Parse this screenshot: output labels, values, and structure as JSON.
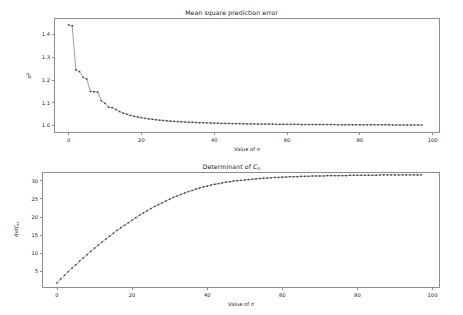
{
  "figure": {
    "width": 463,
    "height": 315,
    "background": "#ffffff",
    "marker_color": "#3f3f3f",
    "line_color": "#5a5a5a",
    "frame_color": "#8d8d8d",
    "text_color": "#1a1a1a"
  },
  "chart_data": [
    {
      "type": "line",
      "id": "mean-square-prediction-error",
      "title": "Mean square prediction error",
      "title_plain": "Mean square prediction error",
      "xlabel": "Value of n",
      "ylabel": "σ²",
      "ylabel_base": "σ",
      "ylabel_sup": "2",
      "xlim": [
        -4,
        102
      ],
      "ylim": [
        0.968,
        1.472
      ],
      "xticks": [
        0,
        20,
        40,
        60,
        80,
        100
      ],
      "xticklabels": [
        "0",
        "20",
        "40",
        "60",
        "80",
        "100"
      ],
      "yticks": [
        1.0,
        1.1,
        1.2,
        1.3,
        1.4
      ],
      "yticklabels": [
        "1.0",
        "1.1",
        "1.2",
        "1.3",
        "1.4"
      ],
      "grid": false,
      "legend": null,
      "marker": "square",
      "x": [
        0,
        1,
        2,
        3,
        4,
        5,
        6,
        7,
        8,
        9,
        10,
        11,
        12,
        13,
        14,
        15,
        16,
        17,
        18,
        19,
        20,
        21,
        22,
        23,
        24,
        25,
        26,
        27,
        28,
        29,
        30,
        31,
        32,
        33,
        34,
        35,
        36,
        37,
        38,
        39,
        40,
        41,
        42,
        43,
        44,
        45,
        46,
        47,
        48,
        49,
        50,
        51,
        52,
        53,
        54,
        55,
        56,
        57,
        58,
        59,
        60,
        61,
        62,
        63,
        64,
        65,
        66,
        67,
        68,
        69,
        70,
        71,
        72,
        73,
        74,
        75,
        76,
        77,
        78,
        79,
        80,
        81,
        82,
        83,
        84,
        85,
        86,
        87,
        88,
        89,
        90,
        91,
        92,
        93,
        94,
        95,
        96,
        97
      ],
      "values": [
        1.442,
        1.438,
        1.245,
        1.237,
        1.212,
        1.205,
        1.15,
        1.149,
        1.147,
        1.11,
        1.098,
        1.081,
        1.079,
        1.071,
        1.062,
        1.055,
        1.05,
        1.045,
        1.041,
        1.038,
        1.035,
        1.032,
        1.03,
        1.028,
        1.026,
        1.024,
        1.023,
        1.021,
        1.02,
        1.019,
        1.018,
        1.017,
        1.016,
        1.015,
        1.015,
        1.014,
        1.013,
        1.013,
        1.012,
        1.012,
        1.011,
        1.011,
        1.01,
        1.01,
        1.01,
        1.009,
        1.009,
        1.009,
        1.008,
        1.008,
        1.008,
        1.008,
        1.007,
        1.007,
        1.007,
        1.007,
        1.007,
        1.006,
        1.006,
        1.006,
        1.006,
        1.006,
        1.006,
        1.006,
        1.005,
        1.005,
        1.005,
        1.005,
        1.005,
        1.005,
        1.005,
        1.005,
        1.005,
        1.005,
        1.004,
        1.004,
        1.004,
        1.004,
        1.004,
        1.004,
        1.004,
        1.004,
        1.004,
        1.004,
        1.004,
        1.004,
        1.004,
        1.004,
        1.004,
        1.003,
        1.003,
        1.003,
        1.003,
        1.003,
        1.003,
        1.003,
        1.003,
        1.003
      ]
    },
    {
      "type": "line",
      "id": "determinant-of-cn",
      "title": "Determinant of Cn",
      "title_base": "Determinant of ",
      "title_italic": "C",
      "title_sub": "n",
      "xlabel": "Value of n",
      "ylabel": "detCn",
      "ylabel_base": "det",
      "ylabel_italic": "C",
      "ylabel_sub": "n",
      "xlim": [
        -4,
        102
      ],
      "ylim": [
        0.4,
        32.4
      ],
      "xticks": [
        0,
        20,
        40,
        60,
        80,
        100
      ],
      "xticklabels": [
        "0",
        "20",
        "40",
        "60",
        "80",
        "100"
      ],
      "yticks": [
        5,
        10,
        15,
        20,
        25,
        30
      ],
      "yticklabels": [
        "5",
        "10",
        "15",
        "20",
        "25",
        "30"
      ],
      "grid": false,
      "legend": null,
      "marker": "square",
      "x": [
        0,
        1,
        2,
        3,
        4,
        5,
        6,
        7,
        8,
        9,
        10,
        11,
        12,
        13,
        14,
        15,
        16,
        17,
        18,
        19,
        20,
        21,
        22,
        23,
        24,
        25,
        26,
        27,
        28,
        29,
        30,
        31,
        32,
        33,
        34,
        35,
        36,
        37,
        38,
        39,
        40,
        41,
        42,
        43,
        44,
        45,
        46,
        47,
        48,
        49,
        50,
        51,
        52,
        53,
        54,
        55,
        56,
        57,
        58,
        59,
        60,
        61,
        62,
        63,
        64,
        65,
        66,
        67,
        68,
        69,
        70,
        71,
        72,
        73,
        74,
        75,
        76,
        77,
        78,
        79,
        80,
        81,
        82,
        83,
        84,
        85,
        86,
        87,
        88,
        89,
        90,
        91,
        92,
        93,
        94,
        95,
        96,
        97
      ],
      "values": [
        1.8,
        2.9,
        3.9,
        4.9,
        5.9,
        6.8,
        7.8,
        8.7,
        9.6,
        10.5,
        11.4,
        12.2,
        13.1,
        13.9,
        14.7,
        15.5,
        16.3,
        17.0,
        17.7,
        18.4,
        19.1,
        19.8,
        20.5,
        21.1,
        21.7,
        22.3,
        22.9,
        23.4,
        23.9,
        24.4,
        24.9,
        25.4,
        25.8,
        26.2,
        26.6,
        27.0,
        27.3,
        27.7,
        28.0,
        28.3,
        28.5,
        28.8,
        29.0,
        29.2,
        29.4,
        29.6,
        29.7,
        29.9,
        30.0,
        30.1,
        30.2,
        30.3,
        30.4,
        30.5,
        30.6,
        30.7,
        30.7,
        30.8,
        30.9,
        30.9,
        31.0,
        31.0,
        31.1,
        31.1,
        31.1,
        31.2,
        31.2,
        31.2,
        31.3,
        31.3,
        31.3,
        31.3,
        31.4,
        31.4,
        31.4,
        31.4,
        31.4,
        31.4,
        31.5,
        31.5,
        31.5,
        31.5,
        31.5,
        31.5,
        31.5,
        31.5,
        31.6,
        31.6,
        31.6,
        31.6,
        31.6,
        31.6,
        31.6,
        31.6,
        31.6,
        31.6,
        31.6,
        31.6
      ]
    }
  ]
}
